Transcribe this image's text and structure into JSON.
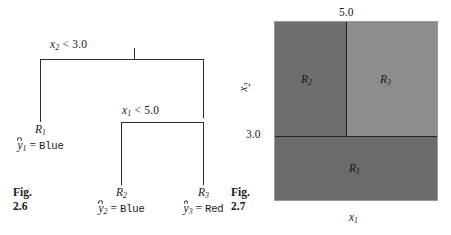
{
  "figure": {
    "left_caption": {
      "line1": "Fig.",
      "line2": "2.6"
    },
    "right_caption": {
      "line1": "Fig.",
      "line2": "2.7"
    }
  },
  "tree": {
    "root_split": {
      "var": "x",
      "var_sub": "2",
      "relation": "< 3.0",
      "full": "x2 < 3.0"
    },
    "inner_split": {
      "var": "x",
      "var_sub": "1",
      "relation": "< 5.0",
      "full": "x1 < 5.0"
    },
    "leaves": [
      {
        "name": "R",
        "name_sub": "1",
        "pred_var": "y",
        "pred_sub": "1",
        "eq": "=",
        "value": "Blue"
      },
      {
        "name": "R",
        "name_sub": "2",
        "pred_var": "y",
        "pred_sub": "2",
        "eq": "=",
        "value": "Blue"
      },
      {
        "name": "R",
        "name_sub": "3",
        "pred_var": "y",
        "pred_sub": "3",
        "eq": "=",
        "value": "Red"
      }
    ]
  },
  "region_plot": {
    "x_axis_label": "x",
    "x_axis_sub": "1",
    "y_axis_label": "x",
    "y_axis_sub": "2",
    "ticks": {
      "top": "5.0",
      "left": "3.0"
    },
    "regions": [
      {
        "name": "R",
        "sub": "1",
        "color": "#6e6e6e"
      },
      {
        "name": "R",
        "sub": "2",
        "color": "#6e6e6e"
      },
      {
        "name": "R",
        "sub": "3",
        "color": "#8c8c8c"
      }
    ],
    "split_values": {
      "x1": 5.0,
      "x2": 3.0
    },
    "border_color": "#232323"
  }
}
